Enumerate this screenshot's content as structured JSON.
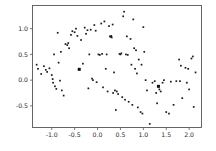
{
  "chart_data": {
    "type": "scatter",
    "title": "",
    "xlabel": "",
    "ylabel": "",
    "xlim": [
      -1.42,
      2.27
    ],
    "ylim": [
      -0.92,
      1.45
    ],
    "grid": false,
    "legend": null,
    "xticks": [
      -1.0,
      -0.5,
      0.0,
      0.5,
      1.0,
      1.5,
      2.0
    ],
    "xticklabels": [
      "-1.0",
      "-0.5",
      "0.0",
      "0.5",
      "1.0",
      "1.5",
      "2.0"
    ],
    "yticks": [
      -0.5,
      0.0,
      0.5,
      1.0
    ],
    "yticklabels": [
      "-0.5",
      "0.0",
      "0.5",
      "1.0"
    ],
    "marker": "square",
    "marker_color": "#1a1a1a",
    "marker_size_small": 1.7,
    "marker_size_large": 3.0,
    "series": [
      {
        "name": "points",
        "points": [
          [
            -1.33,
            0.3
          ],
          [
            -1.3,
            0.22
          ],
          [
            -1.23,
            0.12
          ],
          [
            -1.17,
            0.27
          ],
          [
            -1.13,
            0.2
          ],
          [
            -1.1,
            0.16
          ],
          [
            -1.05,
            0.23
          ],
          [
            -1.0,
            0.1
          ],
          [
            -0.98,
            0.02
          ],
          [
            -0.97,
            -0.05
          ],
          [
            -0.95,
            0.5
          ],
          [
            -0.93,
            -0.12
          ],
          [
            -0.9,
            -0.17
          ],
          [
            -0.87,
            0.92
          ],
          [
            -0.85,
            0.34
          ],
          [
            -0.82,
            -0.01
          ],
          [
            -0.8,
            0.55
          ],
          [
            -0.78,
            -0.2
          ],
          [
            -0.74,
            -0.3
          ],
          [
            -0.7,
            0.7
          ],
          [
            -0.66,
            0.68
          ],
          [
            -0.64,
            0.72
          ],
          [
            -0.62,
            0.62
          ],
          [
            -0.58,
            0.88
          ],
          [
            -0.55,
            0.95
          ],
          [
            -0.5,
            0.93
          ],
          [
            -0.47,
            1.0
          ],
          [
            -0.44,
            0.86
          ],
          [
            -0.4,
            0.21
          ],
          [
            -0.36,
            0.78
          ],
          [
            -0.32,
            0.32
          ],
          [
            -0.28,
            1.02
          ],
          [
            -0.25,
            0.9
          ],
          [
            -0.22,
            0.97
          ],
          [
            -0.2,
            -0.16
          ],
          [
            -0.18,
            0.5
          ],
          [
            -0.15,
            0.98
          ],
          [
            -0.12,
            0.03
          ],
          [
            -0.1,
            0.0
          ],
          [
            -0.07,
            1.07
          ],
          [
            -0.04,
            0.96
          ],
          [
            -0.02,
            -0.04
          ],
          [
            0.02,
            0.5
          ],
          [
            0.05,
            0.49
          ],
          [
            0.08,
            1.1
          ],
          [
            0.1,
            0.51
          ],
          [
            0.12,
            -0.14
          ],
          [
            0.15,
            1.14
          ],
          [
            0.18,
            0.22
          ],
          [
            0.2,
            0.5
          ],
          [
            0.22,
            -0.22
          ],
          [
            0.25,
            1.05
          ],
          [
            0.27,
            0.85
          ],
          [
            0.29,
            0.84
          ],
          [
            0.3,
            0.86
          ],
          [
            0.31,
            0.83
          ],
          [
            0.33,
            1.08
          ],
          [
            0.34,
            -0.25
          ],
          [
            0.36,
            0.15
          ],
          [
            0.38,
            -0.2
          ],
          [
            0.4,
            -0.58
          ],
          [
            0.42,
            -0.22
          ],
          [
            0.45,
            -0.27
          ],
          [
            0.48,
            0.51
          ],
          [
            0.5,
            0.5
          ],
          [
            0.52,
            0.52
          ],
          [
            0.54,
            -0.33
          ],
          [
            0.56,
            1.24
          ],
          [
            0.58,
            1.33
          ],
          [
            0.6,
            -0.38
          ],
          [
            0.62,
            0.5
          ],
          [
            0.64,
            0.85
          ],
          [
            0.66,
            0.49
          ],
          [
            0.68,
            -0.42
          ],
          [
            0.72,
            0.8
          ],
          [
            0.74,
            0.3
          ],
          [
            0.76,
            -0.48
          ],
          [
            0.78,
            1.18
          ],
          [
            0.8,
            0.62
          ],
          [
            0.82,
            0.22
          ],
          [
            0.84,
            0.58
          ],
          [
            0.86,
            0.13
          ],
          [
            0.88,
            -0.53
          ],
          [
            0.9,
            0.4
          ],
          [
            0.94,
            -0.62
          ],
          [
            0.96,
            0.3
          ],
          [
            0.98,
            -0.65
          ],
          [
            1.0,
            1.03
          ],
          [
            1.02,
            0.55
          ],
          [
            1.05,
            0.0
          ],
          [
            1.08,
            -0.2
          ],
          [
            1.14,
            -0.85
          ],
          [
            1.2,
            -0.05
          ],
          [
            1.25,
            -0.02
          ],
          [
            1.28,
            -0.25
          ],
          [
            1.3,
            -0.45
          ],
          [
            1.33,
            -0.12
          ],
          [
            1.35,
            -0.18
          ],
          [
            1.38,
            -0.22
          ],
          [
            1.42,
            -0.05
          ],
          [
            1.45,
            0.0
          ],
          [
            1.5,
            -0.62
          ],
          [
            1.56,
            -0.65
          ],
          [
            1.6,
            -0.03
          ],
          [
            1.66,
            -0.48
          ],
          [
            1.72,
            -0.02
          ],
          [
            1.78,
            0.4
          ],
          [
            1.8,
            -0.02
          ],
          [
            1.82,
            0.28
          ],
          [
            1.85,
            -0.35
          ],
          [
            1.92,
            0.24
          ],
          [
            1.95,
            -0.05
          ],
          [
            1.98,
            0.22
          ],
          [
            2.0,
            -0.18
          ],
          [
            2.05,
            0.42
          ],
          [
            2.08,
            0.46
          ],
          [
            2.1,
            -0.52
          ],
          [
            2.14,
            0.15
          ]
        ]
      },
      {
        "name": "highlighted-points",
        "points": [
          [
            -0.4,
            0.21
          ],
          [
            1.33,
            -0.12
          ]
        ]
      }
    ]
  },
  "figure": {
    "background_color": "#ffffff",
    "axes_color": "#555555",
    "tick_text_color": "#2b2b2b"
  }
}
